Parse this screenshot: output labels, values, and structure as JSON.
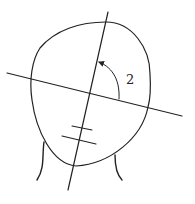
{
  "diagram": {
    "angle_label": "2",
    "colors": {
      "line": "#222222",
      "background": "#ffffff"
    },
    "elements": {
      "head_outline": "closed curve (egg-shaped, tilted)",
      "vertical_axis": "line through head, tilted clockwise",
      "horizontal_axis": "line through head, tilted downward to the right",
      "angle_arc": "curved arrow from horizontal axis to vertical axis",
      "tick_marks": 2,
      "neck_lines": 2
    }
  }
}
